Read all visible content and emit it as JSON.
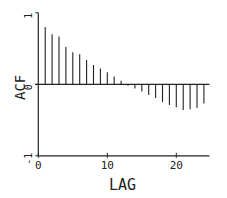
{
  "chart_data": {
    "type": "bar",
    "subtype": "stem",
    "title": "",
    "xlabel": "LAG",
    "ylabel": "ACF",
    "xlim": [
      0,
      25
    ],
    "ylim": [
      -1,
      1
    ],
    "x_ticks": [
      0,
      10,
      20
    ],
    "x_tick_labels": [
      "0",
      "10",
      "20"
    ],
    "y_ticks": [
      -1,
      0,
      1
    ],
    "y_tick_labels": [
      "-1",
      "0",
      "1"
    ],
    "grid": false,
    "legend": null,
    "categories": [
      1,
      2,
      3,
      4,
      5,
      6,
      7,
      8,
      9,
      10,
      11,
      12,
      13,
      14,
      15,
      16,
      17,
      18,
      19,
      20,
      21,
      22,
      23,
      24
    ],
    "values": [
      0.8,
      0.7,
      0.67,
      0.52,
      0.45,
      0.42,
      0.34,
      0.27,
      0.22,
      0.17,
      0.11,
      0.05,
      -0.02,
      -0.06,
      -0.1,
      -0.15,
      -0.19,
      -0.25,
      -0.29,
      -0.32,
      -0.36,
      -0.35,
      -0.33,
      -0.27
    ]
  },
  "colors": {
    "line": "#222222",
    "background": "#ffffff"
  }
}
